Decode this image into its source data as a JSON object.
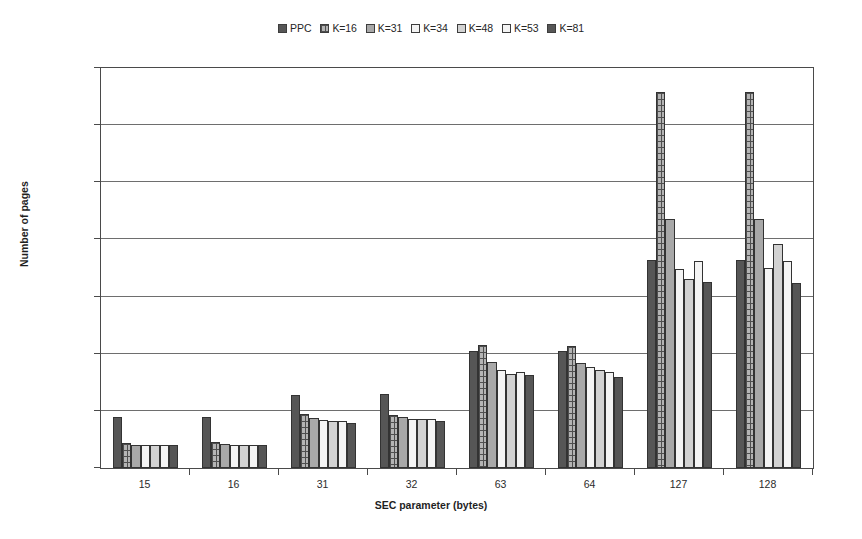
{
  "chart_data": {
    "type": "bar",
    "title": "",
    "xlabel": "SEC parameter (bytes)",
    "ylabel": "Number of pages",
    "categories": [
      "15",
      "16",
      "31",
      "32",
      "63",
      "64",
      "127",
      "128"
    ],
    "ylim": [
      0,
      350
    ],
    "yticks": [
      0,
      50,
      100,
      150,
      200,
      250,
      300,
      350
    ],
    "ytick_labels": [
      "0 M",
      "50 M",
      "100 M",
      "150 M",
      "200 M",
      "250 M",
      "300 M",
      "350 M"
    ],
    "yunit": "M",
    "grid": true,
    "legend_position": "top-center",
    "series": [
      {
        "name": "PPC",
        "color": "#565656",
        "fill": "fill-solid-dark",
        "values": [
          45,
          45,
          64,
          65,
          102,
          102,
          182,
          182
        ]
      },
      {
        "name": "K=16",
        "color": "#b4b4b4",
        "fill": "fill-checker",
        "values": [
          22,
          23,
          47,
          46,
          108,
          107,
          329,
          329
        ]
      },
      {
        "name": "K=31",
        "color": "#a8a8a8",
        "fill": "fill-solid-mid",
        "values": [
          20,
          21,
          44,
          45,
          93,
          92,
          218,
          218
        ]
      },
      {
        "name": "K=34",
        "color": "#f4f4f4",
        "fill": "fill-solid-white",
        "values": [
          20,
          20,
          42,
          43,
          86,
          88,
          174,
          175
        ]
      },
      {
        "name": "K=48",
        "color": "#d2d2d2",
        "fill": "fill-solid-light",
        "values": [
          20,
          20,
          41,
          43,
          82,
          86,
          165,
          196
        ]
      },
      {
        "name": "K=53",
        "color": "#f4f4f4",
        "fill": "fill-solid-white",
        "values": [
          20,
          20,
          41,
          43,
          84,
          84,
          181,
          181
        ]
      },
      {
        "name": "K=81",
        "color": "#565656",
        "fill": "fill-solid-dark",
        "values": [
          20,
          20,
          39,
          41,
          81,
          80,
          163,
          162
        ]
      }
    ]
  }
}
